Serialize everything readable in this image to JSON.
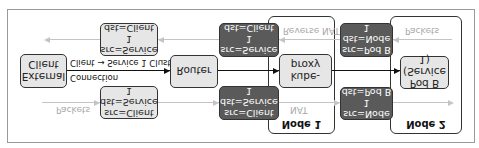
{
  "diagram": {
    "orientation": "vertically flipped",
    "components": {
      "external_client": "External\nClient",
      "router": "Router",
      "kube_proxy": "kube-proxy",
      "pod_b": "Pod B\n(Service 1)"
    },
    "nodes": {
      "node1": "Node 1",
      "node2": "Node 2"
    },
    "connection": {
      "label_line1": "Client → Service 1 Cluster IP",
      "label_line2": "Connection"
    },
    "forward_path": {
      "label": "Packets",
      "nat_label": "NAT",
      "hops": [
        {
          "src": "src=Client",
          "dst": "dst=Service 1",
          "style": "light"
        },
        {
          "src": "src=Client",
          "dst": "dst=Service 1",
          "style": "dark"
        },
        {
          "src": "src=Node 1",
          "dst": "dst=Pod B",
          "style": "dark"
        }
      ]
    },
    "return_path": {
      "label": "Packets",
      "reverse_nat_label": "Reverse NAT",
      "hops": [
        {
          "src": "src=Pod B",
          "dst": "dst=Node 1",
          "style": "dark"
        },
        {
          "src": "src=Service 1",
          "dst": "dst=Client",
          "style": "dark"
        },
        {
          "src": "src=Service 1",
          "dst": "dst=Client",
          "style": "light"
        }
      ]
    }
  }
}
